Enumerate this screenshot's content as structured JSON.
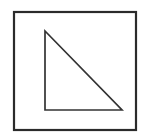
{
  "canvas": {
    "width": 141,
    "height": 135,
    "background_color": "#ffffff"
  },
  "figure": {
    "shapes": [
      {
        "name": "outer-square",
        "type": "rectangle",
        "x": 14,
        "y": 12,
        "width": 122,
        "height": 118,
        "stroke_color": "#2b2b2b",
        "stroke_width": 2.2,
        "fill": "none"
      },
      {
        "name": "inner-right-triangle",
        "type": "polygon",
        "points": "45,31 45,110 122,110",
        "vertices": [
          {
            "label": "apex-top-left",
            "x": 45,
            "y": 31
          },
          {
            "label": "right-angle-bottom-left",
            "x": 45,
            "y": 110
          },
          {
            "label": "vertex-bottom-right",
            "x": 122,
            "y": 110
          }
        ],
        "stroke_color": "#333333",
        "stroke_width": 1.7,
        "fill": "none"
      }
    ]
  }
}
